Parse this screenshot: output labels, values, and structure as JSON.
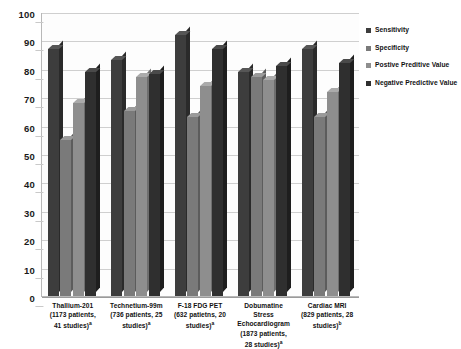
{
  "chart_data": {
    "type": "bar",
    "title": "",
    "subtitle": "",
    "xlabel": "",
    "ylabel": "",
    "ylim": [
      0,
      100
    ],
    "ytick_step": 10,
    "yticks": [
      "100",
      "90",
      "80",
      "70",
      "60",
      "50",
      "40",
      "30",
      "20",
      "10",
      "0"
    ],
    "grid": true,
    "legend_position": "right",
    "style_3d": true,
    "categories": [
      "Thallium-201\n(1173 patients,\n41 studies)a",
      "Technetium-99m\n(736 patients, 25\nstudies)a",
      "F-18 FDG PET\n(632 patietns, 20\nstudies)a",
      "Dobumatine\nStress\nEchocardiogram\n(1873 patients,\n28 studies)a",
      "Cardiac MRI\n(829 patients, 28\nstudies)b"
    ],
    "series": [
      {
        "name": "Sensitivity",
        "color": "#3d3d3d",
        "values": [
          87,
          83,
          92,
          79,
          87
        ]
      },
      {
        "name": "Specificity",
        "color": "#7a7a7a",
        "values": [
          55,
          65,
          63,
          77,
          63
        ]
      },
      {
        "name": "Postive Preditive Value",
        "color": "#8e8e8e",
        "values": [
          68,
          77,
          74,
          76,
          72
        ]
      },
      {
        "name": "Negative Predictive Value",
        "color": "#2f2f2f",
        "values": [
          79,
          78,
          87,
          81,
          82
        ]
      }
    ]
  },
  "axis": {
    "y_ticks": [
      {
        "label": "100",
        "value": 100
      },
      {
        "label": "90",
        "value": 90
      },
      {
        "label": "80",
        "value": 80
      },
      {
        "label": "70",
        "value": 70
      },
      {
        "label": "60",
        "value": 60
      },
      {
        "label": "50",
        "value": 50
      },
      {
        "label": "40",
        "value": 40
      },
      {
        "label": "30",
        "value": 30
      },
      {
        "label": "20",
        "value": 20
      },
      {
        "label": "10",
        "value": 10
      },
      {
        "label": "0",
        "value": 0
      }
    ]
  },
  "x_categories": [
    {
      "line1": "Thallium-201",
      "line2": "(1173 patients,",
      "line3": "41 studies)",
      "line4": "",
      "sup": "a"
    },
    {
      "line1": "Technetium-99m",
      "line2": "(736 patients, 25",
      "line3": "studies)",
      "line4": "",
      "sup": "a"
    },
    {
      "line1": "F-18 FDG PET",
      "line2": "(632 patietns, 20",
      "line3": "studies)",
      "line4": "",
      "sup": "a"
    },
    {
      "line1": "Dobumatine",
      "line2": "Stress",
      "line3": "Echocardiogram",
      "line4": "(1873 patients,",
      "line5": "28 studies)",
      "sup": "a"
    },
    {
      "line1": "Cardiac MRI",
      "line2": "(829 patients, 28",
      "line3": "studies)",
      "line4": "",
      "sup": "b"
    }
  ],
  "legend": {
    "items": [
      {
        "label": "Sensitivity",
        "color": "#3d3d3d",
        "marker": "square-marker"
      },
      {
        "label": "Specificity",
        "color": "#7a7a7a",
        "marker": "square-marker"
      },
      {
        "label": "Postive Preditive Value",
        "color": "#8e8e8e",
        "marker": "square-marker"
      },
      {
        "label": "Negative Predictive Value",
        "color": "#2f2f2f",
        "marker": "square-marker"
      }
    ]
  },
  "colors": {
    "background": "#ffffff",
    "plot_background": "#fdfdfd",
    "gridline": "#cfcfcf",
    "axis": "#9a9a9a",
    "text": "#111111"
  }
}
